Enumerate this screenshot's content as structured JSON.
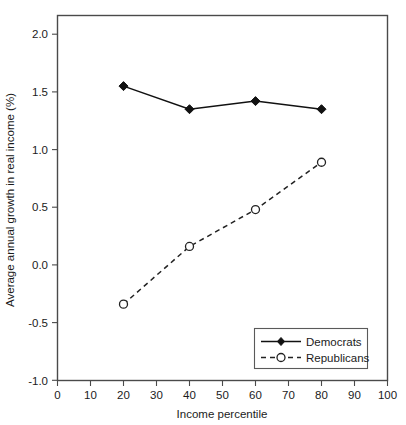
{
  "chart_data": {
    "type": "line",
    "title": "",
    "subtitle": "",
    "xlabel": "Income percentile",
    "ylabel": "Average annual growth in real income (%)",
    "x": [
      20,
      40,
      60,
      80
    ],
    "xlim": [
      0,
      100
    ],
    "ylim": [
      -1.0,
      2.17
    ],
    "grid": false,
    "legend_position": "bottom-right",
    "xticks": [
      "0",
      "10",
      "20",
      "30",
      "40",
      "50",
      "60",
      "70",
      "80",
      "90",
      "100"
    ],
    "xtick_values": [
      0,
      10,
      20,
      30,
      40,
      50,
      60,
      70,
      80,
      90,
      100
    ],
    "yticks": [
      "2.0",
      "1.5",
      "1.0",
      "0.5",
      "0.0",
      "-0.5",
      "-1.0"
    ],
    "ytick_values": [
      2.0,
      1.5,
      1.0,
      0.5,
      0.0,
      -0.5,
      -1.0
    ],
    "series": [
      {
        "name": "Democrats",
        "marker": "filled-diamond",
        "linestyle": "solid",
        "color": "#111111",
        "x": [
          20,
          40,
          60,
          80
        ],
        "values": [
          1.55,
          1.35,
          1.42,
          1.35
        ]
      },
      {
        "name": "Republicans",
        "marker": "open-circle",
        "linestyle": "dashed",
        "color": "#222222",
        "x": [
          20,
          40,
          60,
          80
        ],
        "values": [
          -0.34,
          0.16,
          0.48,
          0.89
        ]
      }
    ],
    "annotations": []
  },
  "legend": {
    "entries": [
      {
        "label": "Democrats"
      },
      {
        "label": "Republicans"
      }
    ]
  },
  "colors": {
    "background": "#ffffff",
    "frame": "#4a4a4a",
    "text": "#1b1b1b",
    "democrats": "#111111",
    "republicans": "#222222"
  }
}
